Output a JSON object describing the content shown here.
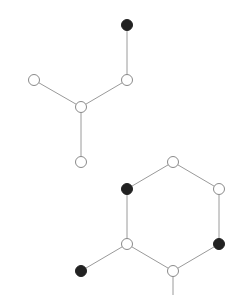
{
  "diagram": {
    "type": "molecular-graph",
    "width": 244,
    "height": 295,
    "node_radius": 5.5,
    "colors": {
      "light_fill": "#ffffff",
      "dark_fill": "#222222",
      "edge": "#9a9a9a",
      "outline": "#8a8a8a"
    },
    "nodes": [
      {
        "id": "n1",
        "x": 127,
        "y": 25,
        "kind": "dark"
      },
      {
        "id": "n2",
        "x": 127,
        "y": 80,
        "kind": "light"
      },
      {
        "id": "n3",
        "x": 34,
        "y": 80,
        "kind": "light"
      },
      {
        "id": "n4",
        "x": 81,
        "y": 107,
        "kind": "light"
      },
      {
        "id": "n5",
        "x": 81,
        "y": 162,
        "kind": "light"
      },
      {
        "id": "n6",
        "x": 173,
        "y": 162,
        "kind": "light"
      },
      {
        "id": "n7",
        "x": 127,
        "y": 189,
        "kind": "dark"
      },
      {
        "id": "n8",
        "x": 219,
        "y": 189,
        "kind": "light"
      },
      {
        "id": "n9",
        "x": 127,
        "y": 244,
        "kind": "light"
      },
      {
        "id": "n10",
        "x": 219,
        "y": 244,
        "kind": "dark"
      },
      {
        "id": "n11",
        "x": 173,
        "y": 271,
        "kind": "light"
      },
      {
        "id": "n12",
        "x": 81,
        "y": 271,
        "kind": "dark"
      }
    ],
    "edges": [
      {
        "from": "n1",
        "to": "n2"
      },
      {
        "from": "n2",
        "to": "n4"
      },
      {
        "from": "n3",
        "to": "n4"
      },
      {
        "from": "n4",
        "to": "n5"
      },
      {
        "from": "n6",
        "to": "n7"
      },
      {
        "from": "n6",
        "to": "n8"
      },
      {
        "from": "n7",
        "to": "n9"
      },
      {
        "from": "n8",
        "to": "n10"
      },
      {
        "from": "n9",
        "to": "n11"
      },
      {
        "from": "n10",
        "to": "n11"
      },
      {
        "from": "n9",
        "to": "n12"
      }
    ],
    "dangling_edges": [
      {
        "from": "n11",
        "x2": 173,
        "y2": 295
      }
    ]
  }
}
